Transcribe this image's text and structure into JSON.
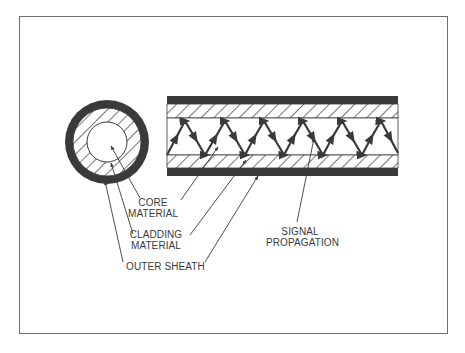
{
  "diagram": {
    "labels": {
      "core": [
        "CORE",
        "MATERIAL"
      ],
      "cladding": [
        "CLADDING",
        "MATERIAL"
      ],
      "sheath": "OUTER SHEATH",
      "signal": [
        "SIGNAL",
        "PROPAGATION"
      ]
    },
    "components": [
      {
        "id": "outer-sheath",
        "fill": "#3a3a3a"
      },
      {
        "id": "cladding",
        "pattern": "diagonal-hatch"
      },
      {
        "id": "core",
        "fill": "#ffffff"
      },
      {
        "id": "signal-path",
        "shape": "zigzag",
        "peaks": 6
      }
    ],
    "colors": {
      "ink": "#3a3a3a",
      "frame": "#6f6f6f",
      "background": "#ffffff"
    }
  }
}
